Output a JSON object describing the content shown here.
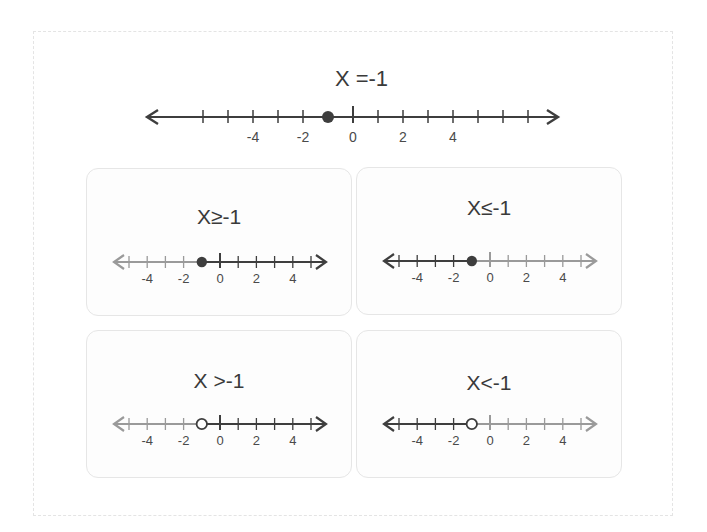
{
  "main": {
    "title": "X =-1",
    "line": {
      "min": -7,
      "max": 7,
      "ticks": [
        -6,
        -5,
        -4,
        -3,
        -2,
        -1,
        0,
        1,
        2,
        3,
        4,
        5,
        6,
        7
      ],
      "labels": [
        "-4",
        "-2",
        "0",
        "2",
        "4"
      ],
      "point": -1,
      "point_type": "closed",
      "shade": "none"
    }
  },
  "cards": [
    {
      "title": "X≥-1",
      "point": -1,
      "point_type": "closed",
      "shade": "right",
      "labels": [
        "-4",
        "-2",
        "0",
        "2",
        "4"
      ]
    },
    {
      "title": "X≤-1",
      "point": -1,
      "point_type": "closed",
      "shade": "left",
      "labels": [
        "-4",
        "-2",
        "0",
        "2",
        "4"
      ]
    },
    {
      "title": "X >-1",
      "point": -1,
      "point_type": "open",
      "shade": "right",
      "labels": [
        "-4",
        "-2",
        "0",
        "2",
        "4"
      ]
    },
    {
      "title": "X<-1",
      "point": -1,
      "point_type": "open",
      "shade": "left",
      "labels": [
        "-4",
        "-2",
        "0",
        "2",
        "4"
      ]
    }
  ],
  "colors": {
    "dark": "#3e3e3e",
    "light": "#9a9a9a",
    "card_border": "#e6e6e6"
  }
}
